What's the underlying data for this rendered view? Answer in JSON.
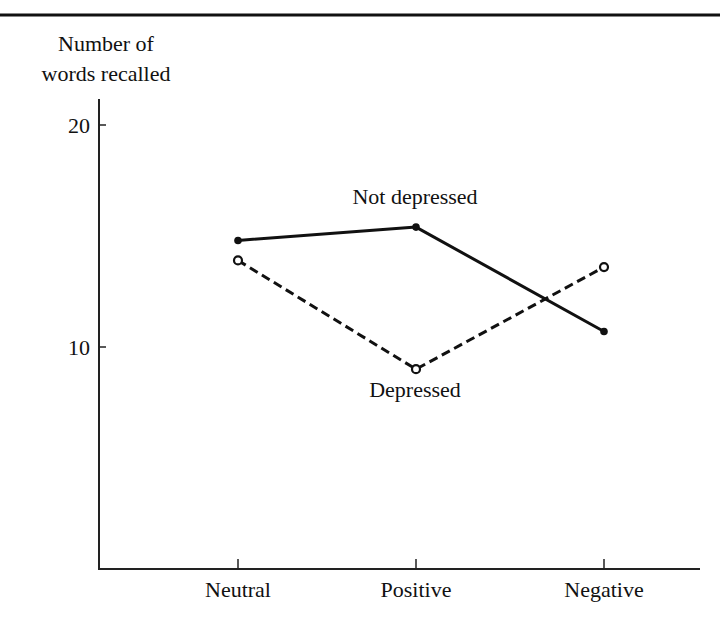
{
  "chart_data": {
    "type": "line",
    "title": "",
    "xlabel": "",
    "ylabel": "Number of words recalled",
    "ylabel_lines": [
      "Number of",
      "words recalled"
    ],
    "categories": [
      "Neutral",
      "Positive",
      "Negative"
    ],
    "series": [
      {
        "name": "Not depressed",
        "values": [
          14.8,
          15.4,
          10.7
        ],
        "style": "solid",
        "marker": "filled-circle",
        "color": "#111111"
      },
      {
        "name": "Depressed",
        "values": [
          13.9,
          9.0,
          13.6
        ],
        "style": "dashed",
        "marker": "open-circle",
        "color": "#111111"
      }
    ],
    "ylim": [
      0,
      21
    ],
    "yticks": [
      10,
      20
    ],
    "ytick_labels": [
      "10",
      "20"
    ],
    "grid": false,
    "legend": "inline labels",
    "annotations": [
      {
        "text": "Not depressed",
        "near": "Positive",
        "series": "Not depressed",
        "position": "above"
      },
      {
        "text": "Depressed",
        "near": "Positive",
        "series": "Depressed",
        "position": "below"
      }
    ]
  }
}
